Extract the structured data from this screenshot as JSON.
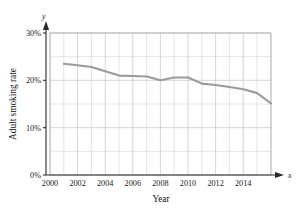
{
  "figure": {
    "top_partial_text": "",
    "background_color": "#ffffff"
  },
  "axes": {
    "y_variable_label": "y",
    "x_variable_label": "x",
    "x_axis_title": "Year",
    "y_axis_title": "Adult smoking rate",
    "y_ticks": [
      "30%",
      "20%",
      "10%",
      "0%"
    ],
    "x_ticks": [
      "2000",
      "2002",
      "2004",
      "2006",
      "2008",
      "2010",
      "2012",
      "2014"
    ]
  },
  "colors": {
    "series": "#9a9a9a",
    "axis": "#2b2b2b",
    "grid_minor": "#c8c8cf",
    "grid_major": "#b9b9c2"
  },
  "chart_data": {
    "type": "line",
    "title": "",
    "xlabel": "Year",
    "ylabel": "Adult smoking rate",
    "xlim": [
      1999,
      2015
    ],
    "ylim": [
      0,
      30
    ],
    "y_tick_values": [
      0,
      10,
      20,
      30
    ],
    "y_tick_labels": [
      "0%",
      "10%",
      "20%",
      "30%"
    ],
    "x_tick_values": [
      2000,
      2002,
      2004,
      2006,
      2008,
      2010,
      2012,
      2014
    ],
    "x_tick_labels": [
      "2000",
      "2002",
      "2004",
      "2006",
      "2008",
      "2010",
      "2012",
      "2014"
    ],
    "grid": true,
    "grid_minor_x_step": 1,
    "grid_minor_y_step": 5,
    "legend": "none",
    "x": [
      2000,
      2001,
      2002,
      2003,
      2004,
      2005,
      2006,
      2007,
      2008,
      2009,
      2010,
      2011,
      2012,
      2013,
      2014,
      2015
    ],
    "series": [
      {
        "name": "Adult smoking rate",
        "color": "#9a9a9a",
        "values": [
          23.5,
          23.2,
          22.8,
          21.9,
          21.0,
          20.9,
          20.8,
          20.0,
          20.6,
          20.6,
          19.3,
          19.0,
          18.6,
          18.1,
          17.3,
          15.1
        ]
      }
    ]
  }
}
